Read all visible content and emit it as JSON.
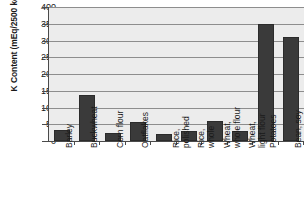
{
  "chart_data": {
    "type": "bar",
    "title": "",
    "xlabel": "",
    "ylabel": "K Content (mEq/2500 kcal)",
    "ylim": [
      0,
      400
    ],
    "ytick_step": 50,
    "yticks": [
      "400",
      "350",
      "300",
      "250",
      "200",
      "150",
      "100",
      "50",
      "0"
    ],
    "grid": true,
    "legend": "none",
    "bar_color": "#3a3a3a",
    "plot_background": "#ececec",
    "gridline_color": "#8d8d8d",
    "axis_color": "#4a4a4a",
    "categories": [
      "Barley",
      "Buckwheat",
      "Corn flour",
      "Oatflakes",
      "Rice, polished",
      "Rice, whole",
      "Wheat, whole flour",
      "Wheat, light flour",
      "Potatoes",
      "Bean, soy"
    ],
    "category_lines": [
      [
        "Barley"
      ],
      [
        "Buckwheat"
      ],
      [
        "Corn flour"
      ],
      [
        "Oatflakes"
      ],
      [
        "Rice,",
        "polished"
      ],
      [
        "Rice,",
        "whole"
      ],
      [
        "Wheat,",
        "whole flour"
      ],
      [
        "Wheat,",
        "light flour"
      ],
      [
        "Potatoes"
      ],
      [
        "Bean, soy"
      ]
    ],
    "values": [
      33,
      137,
      23,
      58,
      22,
      30,
      59,
      31,
      348,
      310
    ]
  }
}
